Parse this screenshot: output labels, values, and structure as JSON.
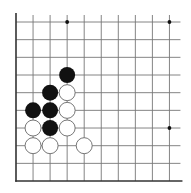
{
  "diagram": {
    "type": "go-board-fragment",
    "corner": "bottom-left",
    "columns": 10,
    "rows": 10,
    "origin_x": 16,
    "origin_y": 22,
    "spacing_x": 17.05,
    "spacing_y": 17.67,
    "line_color": "#777777",
    "edge_color": "#333333",
    "black_color": "#111111",
    "white_fill": "#ffffff",
    "white_stroke": "#666666",
    "star_points": [
      {
        "col": 3,
        "row": 0
      },
      {
        "col": 9,
        "row": 0
      },
      {
        "col": 9,
        "row": 6
      }
    ],
    "stones": [
      {
        "col": 3,
        "row": 3,
        "color": "black"
      },
      {
        "col": 2,
        "row": 4,
        "color": "black"
      },
      {
        "col": 3,
        "row": 4,
        "color": "white"
      },
      {
        "col": 1,
        "row": 5,
        "color": "black"
      },
      {
        "col": 2,
        "row": 5,
        "color": "black"
      },
      {
        "col": 3,
        "row": 5,
        "color": "white"
      },
      {
        "col": 1,
        "row": 6,
        "color": "white"
      },
      {
        "col": 2,
        "row": 6,
        "color": "black"
      },
      {
        "col": 3,
        "row": 6,
        "color": "white"
      },
      {
        "col": 1,
        "row": 7,
        "color": "white"
      },
      {
        "col": 2,
        "row": 7,
        "color": "white"
      },
      {
        "col": 4,
        "row": 7,
        "color": "white"
      }
    ]
  }
}
